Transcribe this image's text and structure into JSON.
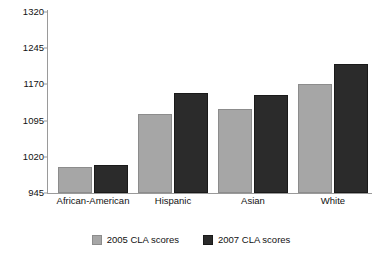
{
  "chart_data": {
    "type": "bar",
    "title": "",
    "subtitle": "",
    "xlabel": "",
    "ylabel": "",
    "grid": false,
    "legend_position": "bottom-center",
    "categories": [
      "African-American",
      "Hispanic",
      "Asian",
      "White"
    ],
    "ylim": [
      945,
      1320
    ],
    "yticks": [
      945,
      1020,
      1095,
      1170,
      1245,
      1320
    ],
    "ytick_labels": [
      "945",
      "1020",
      "1095",
      "1170",
      "1245",
      "1320"
    ],
    "series": [
      {
        "name": "2005 CLA scores",
        "color": "#a6a6a6",
        "values": [
          998,
          1108,
          1120,
          1170
        ]
      },
      {
        "name": "2007 CLA scores",
        "color": "#2b2b2b",
        "values": [
          1003,
          1153,
          1148,
          1212
        ]
      }
    ]
  },
  "axis": {
    "line_color": "#9a9a9a"
  },
  "legend": {
    "items": [
      {
        "label": "2005 CLA scores",
        "swatch": "gray-swatch-icon"
      },
      {
        "label": "2007 CLA scores",
        "swatch": "dark-swatch-icon"
      }
    ]
  }
}
